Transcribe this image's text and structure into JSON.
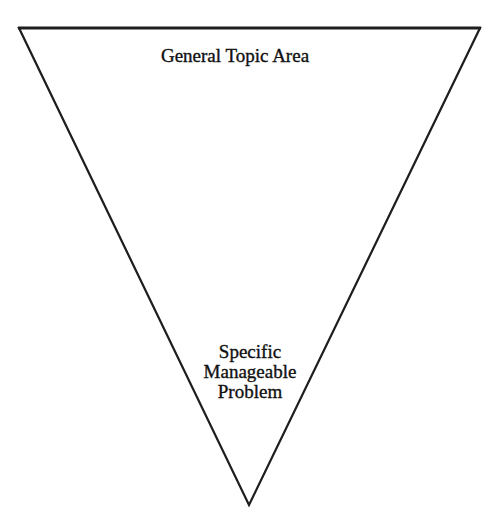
{
  "diagram": {
    "type": "inverted-triangle-funnel",
    "shape": {
      "vertices": [
        [
          19,
          28
        ],
        [
          480,
          28
        ],
        [
          249,
          505
        ]
      ],
      "stroke_color": "#1e1e1e",
      "fill_color": "#ffffff"
    },
    "labels": {
      "top": "General Topic Area",
      "bottom": {
        "line1": "Specific",
        "line2": "Manageable",
        "line3": "Problem"
      }
    }
  }
}
